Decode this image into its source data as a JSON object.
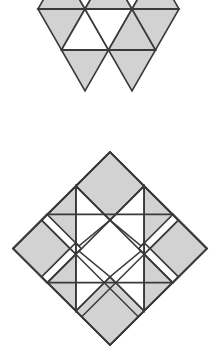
{
  "page": {
    "width": 218,
    "height": 354,
    "background_color": "#ffffff"
  },
  "style": {
    "shaded_fill_color": "#d2d2d2",
    "unshaded_fill_color": "#ffffff",
    "stroke_color": "#3a3a3a",
    "stroke_width": 1.6,
    "fill_texture": "stipple-halftone-gray"
  },
  "figures": [
    {
      "id": "figure-top",
      "name": "triangular-grid-figure",
      "description": "Clipped equilateral triangle grid with alternating shaded and unshaded triangles",
      "shape_type": "triangle-lattice",
      "clipped_at_top_edge": true,
      "bounds": {
        "x": 38,
        "y": 0,
        "width": 142,
        "height": 92
      },
      "rows": 3,
      "triangle_side": 47,
      "triangle_height": 41,
      "shaded_count": 9,
      "unshaded_count": 8
    },
    {
      "id": "figure-bottom",
      "name": "diamond-quilt-figure",
      "description": "Square rotated 45 degrees subdivided into a 4 by 4 grid of cells with shaded corner squares, shaded edge triangles and an unshaded center",
      "shape_type": "rotated-square-quilt",
      "bounds": {
        "x": 13,
        "y": 22,
        "width": 194,
        "height": 193
      },
      "grid": 4,
      "rotation_degrees": 45,
      "center_unshaded": true,
      "vertices": {
        "top": [
          110,
          22
        ],
        "right": [
          207,
          118
        ],
        "bottom": [
          110,
          215
        ],
        "left": [
          13,
          118
        ]
      }
    }
  ]
}
